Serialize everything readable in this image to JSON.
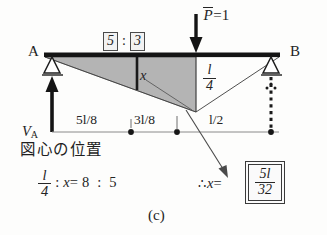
{
  "figure": {
    "caption": "(c)",
    "beam": {
      "left_node_label": "A",
      "right_node_label": "B",
      "left_support_type": "pin-support",
      "right_support_type": "roller-support"
    },
    "load": {
      "symbol": "P",
      "equals": "=",
      "value": "1",
      "direction": "downward"
    },
    "ratio": {
      "left_value": "5",
      "colon": ":",
      "right_value": "3"
    },
    "influence_line": {
      "ordinate_label": "l",
      "ordinate_denominator": "4",
      "segment_label": "x"
    },
    "dimensions": [
      {
        "text_numerator": "5l",
        "text_denominator": "8",
        "label": "5l/8"
      },
      {
        "text_numerator": "3l",
        "text_denominator": "8",
        "label": "3l/8"
      },
      {
        "text_numerator": "l",
        "text_denominator": "2",
        "label": "l/2"
      }
    ],
    "reaction": {
      "symbol": "V",
      "subscript": "A"
    }
  },
  "notes": {
    "centroid_heading": "図心の位置",
    "proportion": {
      "lhs_numerator": "l",
      "lhs_denominator": "4",
      "ratio_sep_1": ":",
      "unknown": "x",
      "equals": "=",
      "rhs_left": "8",
      "ratio_sep_2": ":",
      "rhs_right": "5"
    },
    "conclusion": {
      "therefore": "∴",
      "unknown": "x",
      "equals": "=",
      "answer_numerator": "5l",
      "answer_denominator": "32"
    }
  },
  "colors": {
    "ink": "#242424",
    "shade_fill": "#b5b5b5",
    "thin_line": "#6e6e6e",
    "paper": "#fdfdfc"
  }
}
